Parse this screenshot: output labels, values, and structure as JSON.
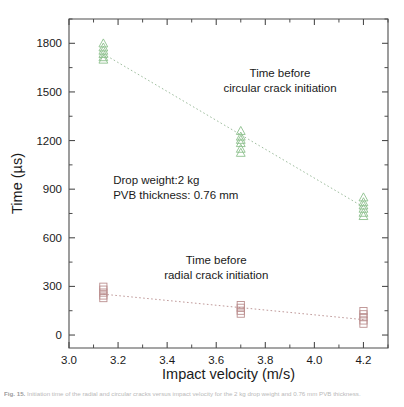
{
  "chart_data": {
    "type": "scatter",
    "title": "",
    "xlabel": "Impact velocity (m/s)",
    "ylabel": "Time (µs)",
    "xlim": [
      3.0,
      4.3
    ],
    "ylim": [
      -80,
      1950
    ],
    "xticks": [
      "3.0",
      "3.2",
      "3.4",
      "3.6",
      "3.8",
      "4.0",
      "4.2"
    ],
    "xtick_values": [
      3.0,
      3.2,
      3.4,
      3.6,
      3.8,
      4.0,
      4.2
    ],
    "yticks": [
      "0",
      "300",
      "600",
      "900",
      "1200",
      "1500",
      "1800"
    ],
    "ytick_values": [
      0,
      300,
      600,
      900,
      1200,
      1500,
      1800
    ],
    "grid": false,
    "legend": "none",
    "minor_ticks": true,
    "series": [
      {
        "name": "Time before circular crack initiation",
        "marker": "triangle-up",
        "color": "#8cc08c",
        "x": [
          3.14,
          3.14,
          3.14,
          3.14,
          3.14,
          3.14,
          3.7,
          3.7,
          3.7,
          3.7,
          3.7,
          3.7,
          4.2,
          4.2,
          4.2,
          4.2,
          4.2,
          4.2
        ],
        "y": [
          1800,
          1775,
          1755,
          1735,
          1715,
          1700,
          1260,
          1225,
          1205,
          1185,
          1150,
          1125,
          850,
          820,
          800,
          780,
          755,
          735
        ],
        "fit": {
          "x": [
            3.14,
            4.2
          ],
          "y": [
            1735,
            790
          ]
        }
      },
      {
        "name": "Time before radial crack initiation",
        "marker": "square",
        "color": "#bb8f8f",
        "x": [
          3.14,
          3.14,
          3.14,
          3.14,
          3.14,
          3.7,
          3.7,
          3.7,
          3.7,
          4.2,
          4.2,
          4.2,
          4.2,
          4.2
        ],
        "y": [
          298,
          280,
          262,
          244,
          228,
          185,
          168,
          150,
          132,
          148,
          128,
          110,
          90,
          70
        ],
        "fit": {
          "x": [
            3.14,
            4.2
          ],
          "y": [
            252,
            95
          ]
        }
      }
    ],
    "annotations": [
      {
        "name": "circular-crack-annotation",
        "lines": [
          "Time before",
          "circular crack initiation"
        ],
        "x": 3.86,
        "y": 1590
      },
      {
        "name": "conditions-annotation",
        "lines": [
          "Drop weight:2 kg",
          "PVB thickness: 0.76 mm"
        ],
        "x": 3.18,
        "y": 930
      },
      {
        "name": "radial-crack-annotation",
        "lines": [
          "Time before",
          "radial crack initiation"
        ],
        "x": 3.6,
        "y": 440
      }
    ]
  },
  "caption": {
    "figure_number": "Fig. 15.",
    "text": "Initiation time of the radial and circular cracks versus impact velocity for the 2 kg drop weight and 0.76 mm PVB thickness."
  },
  "colors": {
    "circular_marker": "#8cc08c",
    "circular_fit": "#9fbe9f",
    "radial_marker": "#bb8f8f",
    "radial_fit": "#c09a9a",
    "axis": "#4d4d4d",
    "text": "#1a1a1a",
    "background": "#ffffff"
  }
}
